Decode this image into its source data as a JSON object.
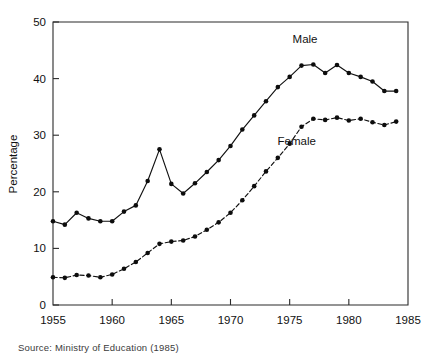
{
  "figure": {
    "source_note": "Source: Ministry of Education (1985)"
  },
  "chart_data": {
    "type": "line",
    "title": "",
    "xlabel": "",
    "ylabel": "Percentage",
    "xlim": [
      1955,
      1985
    ],
    "ylim": [
      0,
      50
    ],
    "grid": false,
    "legend_position": "inline-annotation",
    "x_ticks": [
      "1955",
      "1960",
      "1965",
      "1970",
      "1975",
      "1980",
      "1985"
    ],
    "y_ticks": [
      "0",
      "10",
      "20",
      "30",
      "40",
      "50"
    ],
    "x": [
      1955,
      1956,
      1957,
      1958,
      1959,
      1960,
      1961,
      1962,
      1963,
      1964,
      1965,
      1966,
      1967,
      1968,
      1969,
      1970,
      1971,
      1972,
      1973,
      1974,
      1975,
      1976,
      1977,
      1978,
      1979,
      1980,
      1981,
      1982,
      1983,
      1984
    ],
    "series": [
      {
        "name": "Male",
        "style": "solid",
        "marker": "filled-circle",
        "label_x": 1976.3,
        "label_y": 46.3,
        "values": [
          14.8,
          14.2,
          16.3,
          15.3,
          14.8,
          14.8,
          16.5,
          17.6,
          21.9,
          27.5,
          21.4,
          19.7,
          21.5,
          23.5,
          25.6,
          28.1,
          31.0,
          33.5,
          36.0,
          38.5,
          40.3,
          42.3,
          42.5,
          41.0,
          42.4,
          41.0,
          40.3,
          39.5,
          37.8,
          37.8
        ]
      },
      {
        "name": "Female",
        "style": "dashed",
        "marker": "filled-circle",
        "label_x": 1975.6,
        "label_y": 28.3,
        "values": [
          4.9,
          4.8,
          5.3,
          5.2,
          4.9,
          5.4,
          6.4,
          7.6,
          9.2,
          10.8,
          11.2,
          11.4,
          12.1,
          13.3,
          14.6,
          16.3,
          18.5,
          21.0,
          23.6,
          26.0,
          28.5,
          31.5,
          32.9,
          32.7,
          33.1,
          32.6,
          32.9,
          32.3,
          31.8,
          32.4
        ]
      }
    ]
  }
}
